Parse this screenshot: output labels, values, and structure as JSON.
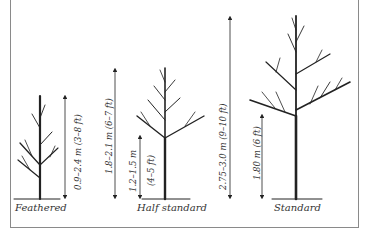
{
  "figure": {
    "trees": [
      {
        "name": "Feathered",
        "height_label": "0.9–2.4 m (3–8 ft)"
      },
      {
        "name": "Half standard",
        "height_label": "1.8–2.1 m (6–7 ft)",
        "stem_label_line1": "1.2–1.5 m",
        "stem_label_line2": "(4–5 ft)"
      },
      {
        "name": "Standard",
        "height_label": "2.75–3.0 m (9–10 ft)",
        "stem_label": "1.80 m (6 ft)"
      }
    ]
  },
  "colors": {
    "ink": "#222222",
    "frame": "#8a8a8a",
    "background": "#ffffff"
  }
}
